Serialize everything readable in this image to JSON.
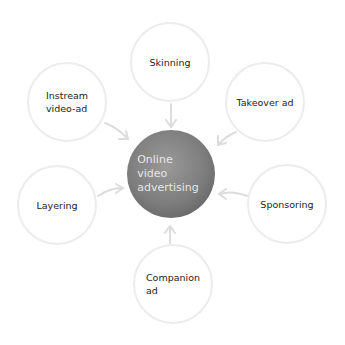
{
  "center": {
    "label": "Online\nvideo\nadvertising"
  },
  "nodes": [
    {
      "id": "skinning",
      "label": "Skinning"
    },
    {
      "id": "instream",
      "label": "Instream\nvideo-ad"
    },
    {
      "id": "takeover",
      "label": "Takeover ad"
    },
    {
      "id": "layering",
      "label": "Layering"
    },
    {
      "id": "sponsoring",
      "label": "Sponsoring"
    },
    {
      "id": "companion",
      "label": "Companion\nad"
    }
  ],
  "colors": {
    "node_border": "#ececec",
    "arrow": "#dddddd",
    "hub": "#7c7c7c"
  }
}
